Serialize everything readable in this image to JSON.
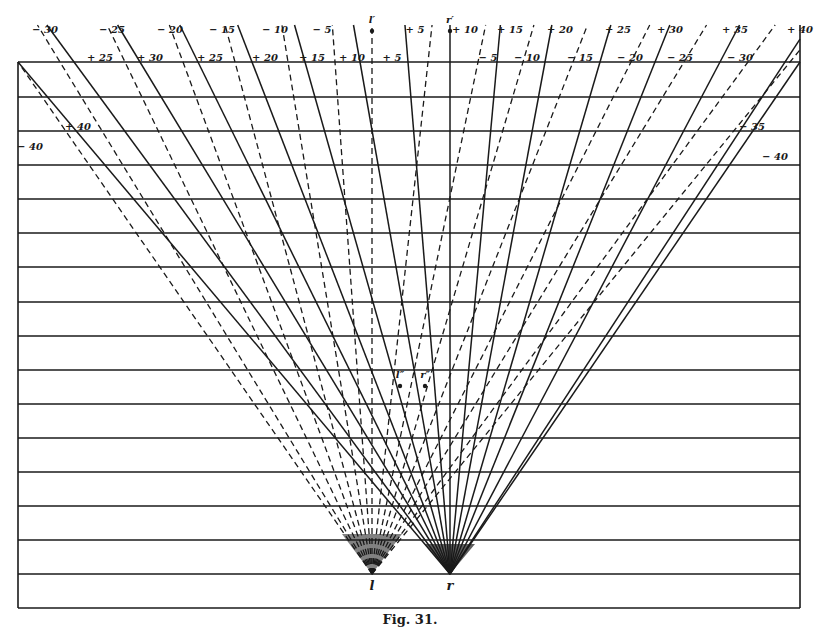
{
  "figure": {
    "caption": "Fig. 31.",
    "frame": {
      "left": 18,
      "right": 800,
      "top": 62,
      "bottom": 608
    },
    "horizontal_lines_y": [
      62,
      97,
      131,
      165,
      199,
      233,
      267,
      302,
      336,
      370,
      404,
      438,
      472,
      506,
      540,
      574,
      608
    ],
    "points": {
      "l": {
        "label": "l",
        "x": 372,
        "y": 574
      },
      "r": {
        "label": "r",
        "x": 450,
        "y": 574
      },
      "l_prime": {
        "label": "l′",
        "x": 372,
        "y": 33
      },
      "r_prime": {
        "label": "r′",
        "x": 450,
        "y": 33
      },
      "l_double_prime": {
        "label": "l″",
        "x": 400,
        "y": 388
      },
      "r_double_prime": {
        "label": "r″",
        "x": 425,
        "y": 388
      }
    },
    "top_labels": [
      {
        "text": "− 30",
        "x": 45
      },
      {
        "text": "− 25",
        "x": 112
      },
      {
        "text": "− 20",
        "x": 170
      },
      {
        "text": "− 15",
        "x": 222
      },
      {
        "text": "− 10",
        "x": 275
      },
      {
        "text": "− 5",
        "x": 322
      },
      {
        "text": "+ 5",
        "x": 415
      },
      {
        "text": "+ 10",
        "x": 465
      },
      {
        "text": "+ 15",
        "x": 510
      },
      {
        "text": "+ 20",
        "x": 560
      },
      {
        "text": "+ 25",
        "x": 618
      },
      {
        "text": "+ 30",
        "x": 670
      },
      {
        "text": "+ 35",
        "x": 735
      },
      {
        "text": "+ 40",
        "x": 800
      }
    ],
    "frame_labels": [
      {
        "text": "+ 25",
        "x": 100,
        "y": 61
      },
      {
        "text": "+ 30",
        "x": 150,
        "y": 61
      },
      {
        "text": "+ 25",
        "x": 210,
        "y": 61
      },
      {
        "text": "+ 20",
        "x": 265,
        "y": 61
      },
      {
        "text": "+ 15",
        "x": 312,
        "y": 61
      },
      {
        "text": "+ 10",
        "x": 352,
        "y": 61
      },
      {
        "text": "+ 5",
        "x": 392,
        "y": 61
      },
      {
        "text": "− 5",
        "x": 488,
        "y": 61
      },
      {
        "text": "− 10",
        "x": 527,
        "y": 61
      },
      {
        "text": "− 15",
        "x": 580,
        "y": 61
      },
      {
        "text": "− 20",
        "x": 630,
        "y": 61
      },
      {
        "text": "− 25",
        "x": 680,
        "y": 61
      },
      {
        "text": "− 30",
        "x": 740,
        "y": 61
      },
      {
        "text": "+ 40",
        "x": 78,
        "y": 130
      },
      {
        "text": "− 40",
        "x": 30,
        "y": 150
      },
      {
        "text": "− 35",
        "x": 752,
        "y": 130
      },
      {
        "text": "− 40",
        "x": 775,
        "y": 160
      }
    ],
    "dashed_rays_from_l_top_x": [
      18,
      60,
      125,
      183,
      235,
      288,
      335,
      372,
      428,
      478,
      523,
      573,
      631,
      684,
      748,
      790
    ],
    "solid_rays_from_r_top_x": [
      18,
      74,
      140,
      198,
      252,
      305,
      360,
      408,
      450,
      497,
      545,
      600,
      655,
      720,
      785,
      800
    ]
  }
}
